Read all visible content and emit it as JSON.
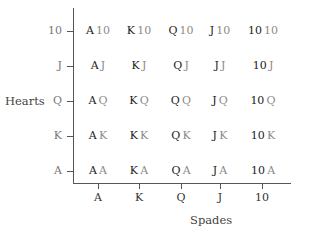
{
  "chart": {
    "y_axis_title": "Hearts",
    "x_axis_title": "Spades",
    "y_ticks": [
      "10",
      "J",
      "Q",
      "K",
      "A"
    ],
    "x_ticks": [
      "A",
      "K",
      "Q",
      "J",
      "10"
    ],
    "colors": {
      "spade_rank": "#222222",
      "heart_rank": "#8a8a8a",
      "axis": "#555555"
    }
  },
  "grid": {
    "rows": [
      {
        "heart": "10",
        "cells": [
          {
            "s": "A",
            "h": "10"
          },
          {
            "s": "K",
            "h": "10"
          },
          {
            "s": "Q",
            "h": "10"
          },
          {
            "s": "J",
            "h": "10"
          },
          {
            "s": "10",
            "h": "10"
          }
        ]
      },
      {
        "heart": "J",
        "cells": [
          {
            "s": "A",
            "h": "J"
          },
          {
            "s": "K",
            "h": "J"
          },
          {
            "s": "Q",
            "h": "J"
          },
          {
            "s": "J",
            "h": "J"
          },
          {
            "s": "10",
            "h": "J"
          }
        ]
      },
      {
        "heart": "Q",
        "cells": [
          {
            "s": "A",
            "h": "Q"
          },
          {
            "s": "K",
            "h": "Q"
          },
          {
            "s": "Q",
            "h": "Q"
          },
          {
            "s": "J",
            "h": "Q"
          },
          {
            "s": "10",
            "h": "Q"
          }
        ]
      },
      {
        "heart": "K",
        "cells": [
          {
            "s": "A",
            "h": "K"
          },
          {
            "s": "K",
            "h": "K"
          },
          {
            "s": "Q",
            "h": "K"
          },
          {
            "s": "J",
            "h": "K"
          },
          {
            "s": "10",
            "h": "K"
          }
        ]
      },
      {
        "heart": "A",
        "cells": [
          {
            "s": "A",
            "h": "A"
          },
          {
            "s": "K",
            "h": "A"
          },
          {
            "s": "Q",
            "h": "A"
          },
          {
            "s": "J",
            "h": "A"
          },
          {
            "s": "10",
            "h": "A"
          }
        ]
      }
    ]
  }
}
